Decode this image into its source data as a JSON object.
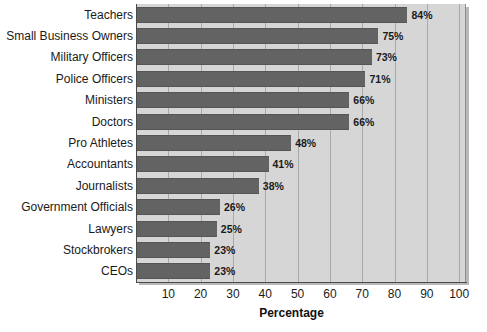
{
  "chart_data": {
    "type": "bar",
    "orientation": "horizontal",
    "title": "",
    "subtitle": "",
    "xlabel": "Percentage",
    "ylabel": "",
    "xlim": [
      0,
      100
    ],
    "ylim": null,
    "grid": true,
    "legend": null,
    "legend_position": "none",
    "xticks": [
      10,
      20,
      30,
      40,
      50,
      60,
      70,
      80,
      90,
      100
    ],
    "xtick_labels": [
      "10",
      "20",
      "30",
      "40",
      "50",
      "60",
      "70",
      "80",
      "90",
      "100"
    ],
    "categories": [
      "Teachers",
      "Small Business Owners",
      "Military Officers",
      "Police Officers",
      "Ministers",
      "Doctors",
      "Pro Athletes",
      "Accountants",
      "Journalists",
      "Government Officials",
      "Lawyers",
      "Stockbrokers",
      "CEOs"
    ],
    "values": [
      84,
      75,
      73,
      71,
      66,
      66,
      48,
      41,
      38,
      26,
      25,
      23,
      23
    ],
    "data_labels": [
      "84%",
      "75%",
      "73%",
      "71%",
      "66%",
      "66%",
      "48%",
      "41%",
      "38%",
      "26%",
      "25%",
      "23%",
      "23%"
    ],
    "colors": {
      "bar": "#636363",
      "plot_background": "#d6d6d6",
      "gridline": "#a9a9a9",
      "axis": "#4a4a4a",
      "text": "#1a1a1a",
      "page_background": "#ffffff"
    }
  }
}
